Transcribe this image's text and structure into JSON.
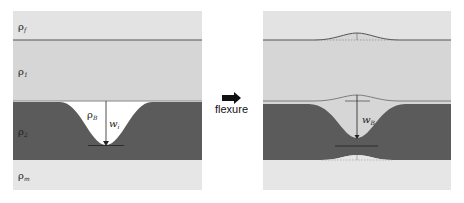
{
  "diagram": {
    "left_panel": {
      "labels": {
        "rho_f": {
          "base": "ρ",
          "sub": "f"
        },
        "rho_1": {
          "base": "ρ",
          "sub": "1"
        },
        "rho_2": {
          "base": "ρ",
          "sub": "2"
        },
        "rho_m": {
          "base": "ρ",
          "sub": "m"
        },
        "rho_B": {
          "base": "ρ",
          "sub": "B"
        },
        "w_i": {
          "base": "w",
          "sub": "i"
        }
      }
    },
    "transition": {
      "label": "flexure",
      "icon": "right-arrow-icon"
    },
    "right_panel": {
      "labels": {
        "w_B": {
          "base": "w",
          "sub": "B"
        }
      }
    },
    "colors": {
      "fluid": "#e3e3e3",
      "layer1": "#d6d6d6",
      "layer2": "#5b5b5b",
      "mantle": "#e6e6e6",
      "line": "#444444"
    }
  }
}
